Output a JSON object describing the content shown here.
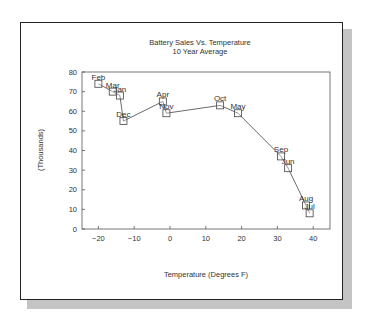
{
  "chart_data": {
    "type": "scatter",
    "title": "Battery Sales Vs. Temperature",
    "subtitle": "10 Year Average",
    "xlabel": "Temperature (Degrees F)",
    "ylabel": "(Thousands)",
    "xlim": [
      -25,
      45
    ],
    "ylim": [
      0,
      80
    ],
    "xticks": [
      -20,
      -10,
      0,
      10,
      20,
      30,
      40
    ],
    "yticks": [
      0,
      10,
      20,
      30,
      40,
      50,
      60,
      70,
      80
    ],
    "grid": false,
    "legend": "none",
    "marker": "square",
    "line_connected": true,
    "points": [
      {
        "label": "Feb",
        "x": -20,
        "y": 74
      },
      {
        "label": "Mar",
        "x": -16,
        "y": 70
      },
      {
        "label": "Jan",
        "x": -14,
        "y": 68
      },
      {
        "label": "Dec",
        "x": -13,
        "y": 55
      },
      {
        "label": "Apr",
        "x": -2,
        "y": 65
      },
      {
        "label": "Nov",
        "x": -1,
        "y": 59
      },
      {
        "label": "Oct",
        "x": 14,
        "y": 63
      },
      {
        "label": "May",
        "x": 19,
        "y": 59
      },
      {
        "label": "Sep",
        "x": 31,
        "y": 37
      },
      {
        "label": "Jun",
        "x": 33,
        "y": 31
      },
      {
        "label": "Aug",
        "x": 38,
        "y": 12
      },
      {
        "label": "Jul",
        "x": 39,
        "y": 8
      }
    ]
  }
}
